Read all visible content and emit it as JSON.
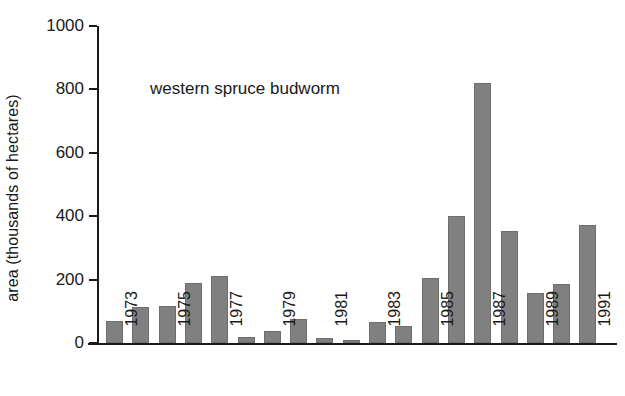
{
  "chart_data": {
    "type": "bar",
    "title": "",
    "xlabel": "",
    "ylabel": "area (thousands of hectares)",
    "ylim": [
      0,
      1000
    ],
    "ytick_values": [
      0,
      200,
      400,
      600,
      800,
      1000
    ],
    "ytick_labels": [
      "0",
      "200",
      "400",
      "600",
      "800",
      "1000"
    ],
    "grid": false,
    "legend": null,
    "annotations": [
      {
        "text": "western spruce budworm",
        "x": 1976,
        "y": 840
      }
    ],
    "categories": [
      "1973",
      "1974",
      "1975",
      "1976",
      "1977",
      "1978",
      "1979",
      "1980",
      "1981",
      "1982",
      "1983",
      "1984",
      "1985",
      "1986",
      "1987",
      "1988",
      "1989",
      "1990",
      "1991"
    ],
    "xtick_labels": [
      "1973",
      "1975",
      "1977",
      "1979",
      "1981",
      "1983",
      "1985",
      "1987",
      "1989",
      "1991"
    ],
    "values": [
      68,
      113,
      118,
      189,
      212,
      20,
      38,
      76,
      15,
      10,
      66,
      53,
      205,
      400,
      820,
      352,
      158,
      186,
      373
    ],
    "bar_color": "#808080",
    "axis_color": "#1a1a1a",
    "background": "#ffffff"
  }
}
